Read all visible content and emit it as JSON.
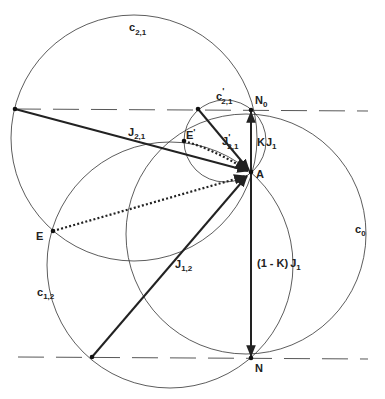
{
  "diagram": {
    "type": "geometric construction",
    "labels": {
      "c21": {
        "base": "c",
        "sub": "2,1"
      },
      "c21p": {
        "base": "c",
        "prime": "'",
        "sub": "2,1"
      },
      "c12": {
        "base": "c",
        "sub": "1,2"
      },
      "c0": {
        "base": "c",
        "sub": "0"
      },
      "N0": {
        "base": "N",
        "sub": "0"
      },
      "N": {
        "base": "N"
      },
      "A": {
        "base": "A"
      },
      "E": {
        "base": "E"
      },
      "Ep": {
        "base": "E",
        "prime": "'"
      },
      "J21": {
        "base": "J",
        "sub": "2,1"
      },
      "J21p": {
        "base": "J",
        "prime": "'",
        "sub": "2,1"
      },
      "J12": {
        "base": "J",
        "sub": "1,2"
      },
      "KJ1": {
        "prefix": "K",
        "base": "J",
        "sub": "1"
      },
      "oneMinusKJ1": {
        "prefix": "(1 - K)",
        "base": "J",
        "sub": "1"
      }
    },
    "circles": [
      "c2,1",
      "c'2,1",
      "c1,2",
      "c0"
    ],
    "points": [
      "N0",
      "N",
      "A",
      "E",
      "E'"
    ],
    "vectors": [
      "J2,1",
      "J'2,1",
      "J1,2",
      "K J1",
      "(1 - K) J1"
    ],
    "dotted_vectors": [
      "E → A",
      "E' → A"
    ],
    "colors": {
      "ink": "#222222",
      "background": "#ffffff"
    }
  }
}
